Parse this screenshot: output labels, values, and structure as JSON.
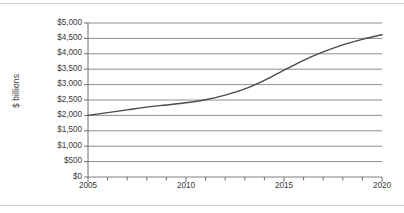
{
  "chart_data": {
    "type": "line",
    "title": "",
    "xlabel": "",
    "ylabel": "$ billions",
    "xlim": [
      2005,
      2020
    ],
    "ylim": [
      0,
      5000
    ],
    "grid": true,
    "legend": false,
    "y_ticks": [
      0,
      500,
      1000,
      1500,
      2000,
      2500,
      3000,
      3500,
      4000,
      4500,
      5000
    ],
    "y_tick_labels": [
      "$0",
      "$500",
      "$1,000",
      "$1,500",
      "$2,000",
      "$2,500",
      "$3,000",
      "$3,500",
      "$4,000",
      "$4,500",
      "$5,000"
    ],
    "x_major_ticks": [
      2005,
      2010,
      2015,
      2020
    ],
    "x_major_tick_labels": [
      "2005",
      "2010",
      "2015",
      "2020"
    ],
    "x_minor_ticks": [
      2006,
      2007,
      2008,
      2009,
      2011,
      2012,
      2013,
      2014,
      2016,
      2017,
      2018,
      2019
    ],
    "series": [
      {
        "name": "",
        "color": "#4a4a4a",
        "x": [
          2005,
          2006,
          2007,
          2008,
          2009,
          2010,
          2011,
          2012,
          2013,
          2014,
          2015,
          2016,
          2017,
          2018,
          2019,
          2020
        ],
        "values": [
          2000,
          2090,
          2180,
          2270,
          2340,
          2410,
          2510,
          2660,
          2860,
          3140,
          3470,
          3790,
          4060,
          4290,
          4470,
          4620
        ]
      }
    ]
  },
  "axes": {
    "y_title": "$ billions"
  },
  "colors": {
    "gridline": "#808080",
    "axis": "#6e6e6e",
    "line": "#4a4a4a",
    "text": "#3a3a3a",
    "rule": "#c9c9c9",
    "background": "#ffffff"
  }
}
